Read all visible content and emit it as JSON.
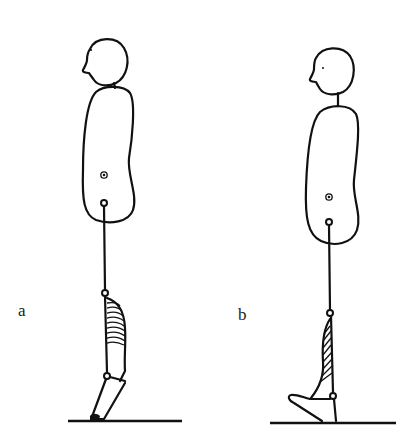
{
  "figure": {
    "panels": [
      {
        "id": "a",
        "label": "a",
        "posture": "standing on toes (heel raised), calf muscle shortened/contracted",
        "parts": [
          "head",
          "torso",
          "center-of-mass-marker",
          "hip-joint",
          "shank",
          "knee-joint",
          "calf-muscle-hatched",
          "ankle-joint",
          "foot",
          "ground-line"
        ]
      },
      {
        "id": "b",
        "label": "b",
        "posture": "standing flat with forefoot lifted (dorsiflexion), calf muscle lengthened",
        "parts": [
          "head",
          "torso",
          "center-of-mass-marker",
          "hip-joint",
          "shank",
          "knee-joint",
          "calf-muscle-hatched",
          "ankle-joint",
          "foot",
          "ground-line"
        ]
      }
    ]
  },
  "colors": {
    "line": "#111111",
    "background": "#ffffff"
  }
}
